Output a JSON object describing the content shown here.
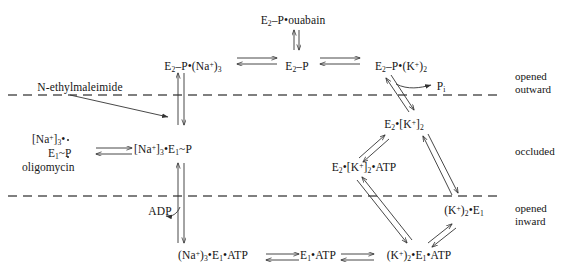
{
  "diagram": {
    "stroke_color": "#333333",
    "membrane_color": "#555555",
    "text_color": "#151515",
    "nodes": [
      {
        "id": "e2p_ouabain",
        "label_html": "E<sub>2</sub>–P•ouabain",
        "x": 293,
        "y": 14
      },
      {
        "id": "e2p_na3",
        "label_html": "E<sub>2</sub>–P•(Na<sup>+</sup>)<sub>3</sub>",
        "x": 193,
        "y": 60
      },
      {
        "id": "e2p",
        "label_html": "E<sub>2</sub>–P",
        "x": 297,
        "y": 60
      },
      {
        "id": "e2p_k2",
        "label_html": "E<sub>2</sub>–P•(K<sup>+</sup>)<sub>2</sub>",
        "x": 401,
        "y": 60
      },
      {
        "id": "pi",
        "label_html": "P<sub>i</sub>",
        "x": 441,
        "y": 87
      },
      {
        "id": "n_ethylmaleimide",
        "label_html": "N-ethylmaleimide",
        "x": 80,
        "y": 88
      },
      {
        "id": "e2_k2_occluded",
        "label_html": "E<sub>2</sub>•[K<sup>+</sup>]<sub>2</sub>",
        "x": 404,
        "y": 125
      },
      {
        "id": "na3_e1p",
        "label_html": "[Na<sup>+</sup>]<sub>3</sub>•E<sub>1</sub>~P",
        "x": 163,
        "y": 150
      },
      {
        "id": "e2_k2_atp",
        "label_html": "E<sub>2</sub>•[K<sup>+</sup>]<sub>2</sub>•ATP",
        "x": 364,
        "y": 168
      },
      {
        "id": "adp",
        "label_html": "ADP",
        "x": 160,
        "y": 212
      },
      {
        "id": "k2_e1",
        "label_html": "(K<sup>+</sup>)<sub>2</sub>•E<sub>1</sub>",
        "x": 464,
        "y": 211
      },
      {
        "id": "na3_e1_atp",
        "label_html": "(Na<sup>+</sup>)<sub>3</sub>•E<sub>1</sub>•ATP",
        "x": 213,
        "y": 256
      },
      {
        "id": "e1_atp",
        "label_html": "E<sub>1</sub>•ATP",
        "x": 318,
        "y": 256
      },
      {
        "id": "k2_e1_atp",
        "label_html": "(K<sup>+</sup>)<sub>2</sub>•E<sub>1</sub>•ATP",
        "x": 419,
        "y": 256
      }
    ],
    "oligomycin_group": {
      "line1_html": "[Na<sup>+</sup>]<sub>3</sub>•",
      "line2_html": "E<sub>1</sub>~P",
      "line3_html": "oligomycin",
      "x": 22,
      "y": 133
    },
    "membrane_lines": [
      {
        "id": "outer-membrane-line",
        "y": 95,
        "x1": 8,
        "x2": 500
      },
      {
        "id": "inner-membrane-line",
        "y": 196,
        "x1": 8,
        "x2": 500
      }
    ],
    "compartment_labels": [
      {
        "id": "opened-outward",
        "line1": "opened",
        "line2": "outward",
        "x": 515,
        "y": 70
      },
      {
        "id": "occluded",
        "line1": "occluded",
        "line2": "",
        "x": 515,
        "y": 145
      },
      {
        "id": "opened-inward",
        "line1": "opened",
        "line2": "inward",
        "x": 515,
        "y": 202
      }
    ]
  }
}
